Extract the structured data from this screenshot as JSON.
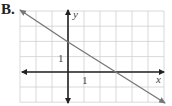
{
  "problem_label": "B.",
  "chart_data": {
    "type": "line",
    "title": "",
    "xlabel": "x",
    "ylabel": "y",
    "xlim": [
      -3,
      6
    ],
    "ylim": [
      -2,
      4
    ],
    "grid": true,
    "tick_labels": {
      "x": "1",
      "y": "1"
    },
    "series": [
      {
        "name": "line",
        "equation": "y = -2/3 x + 2",
        "x": [
          -3,
          0,
          3,
          6
        ],
        "y": [
          4,
          2,
          0,
          -2
        ]
      }
    ],
    "y_intercept": 2,
    "x_intercept": 3
  },
  "colors": {
    "grid": "#cfcfcf",
    "axes": "#222222",
    "line": "#777777"
  }
}
